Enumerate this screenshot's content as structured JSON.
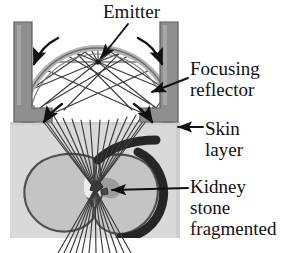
{
  "figure": {
    "background_color": "#ffffff"
  },
  "labels": {
    "emitter": "Emitter",
    "focusing_reflector": "Focusing\nreflector",
    "skin_layer": "Skin\nlayer",
    "kidney_stone": "Kidney\nstone\nfragmented"
  },
  "colors": {
    "housing_gray": "#8c8c8c",
    "housing_stroke": "#5a5a5a",
    "skin_gray": "#d8d8d8",
    "kidney_fill": "#c2c2c2",
    "kidney_outline": "#4a4a4a",
    "renal_dark": "#2b2b2b",
    "ray_stroke": "#3a3a3a",
    "reflector_fill": "#efefef",
    "reflector_stroke": "#9a9a9a",
    "arrow_black": "#111111",
    "text_black": "#111111"
  },
  "geometry": {
    "emitter_point": {
      "x": 98,
      "y": 62
    },
    "focal_point": {
      "x": 95,
      "y": 189
    },
    "skin_layer_top_y": 122,
    "skin_block": {
      "x": 10,
      "y": 122,
      "width": 170,
      "height": 116
    },
    "dome": {
      "cx": 98,
      "cy": 118,
      "rx": 76,
      "ry": 76
    },
    "left_housing": {
      "x": 14,
      "y": 22,
      "width": 18,
      "height": 100
    },
    "right_housing": {
      "x": 160,
      "y": 22,
      "width": 18,
      "height": 100
    }
  },
  "elements": {
    "emitter_name": "emitter-point",
    "reflector_name": "focusing-reflector-dome",
    "skin_name": "skin-layer-block",
    "kidney_name": "kidney-organ",
    "stone_name": "kidney-stone-fragment",
    "ray_bundle_name": "shock-wave-rays"
  }
}
